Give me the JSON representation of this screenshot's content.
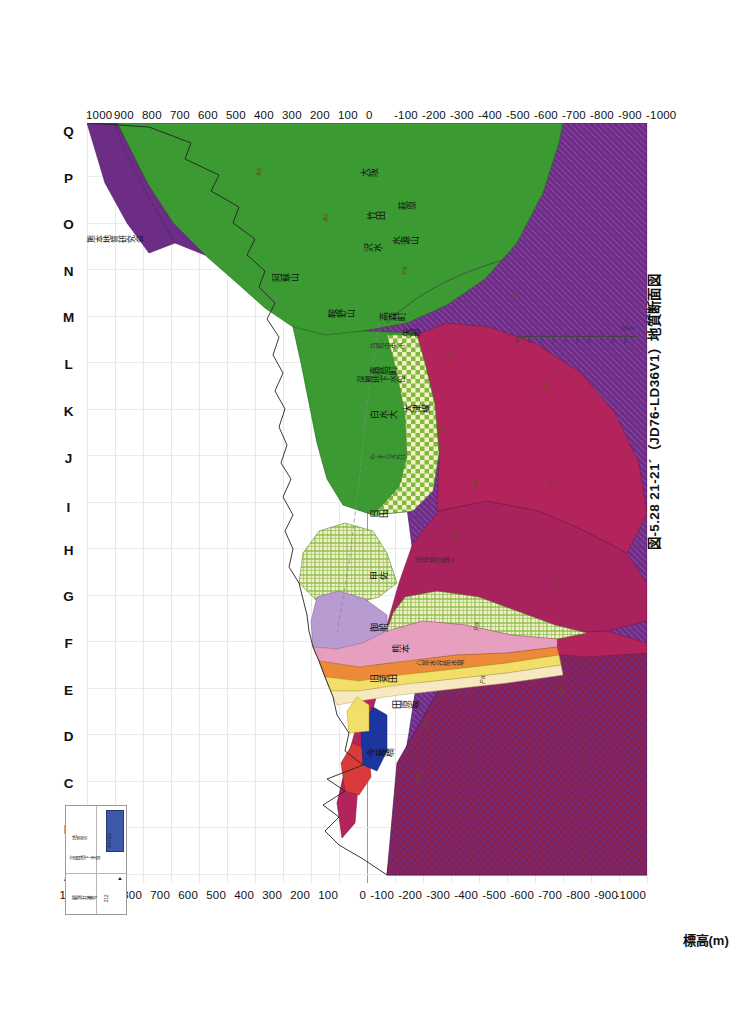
{
  "figure": {
    "caption": "図-5.28  21-21´（JD76-LD36V1）地質断面図",
    "credit": "熊本地質研究会",
    "axis_title": "標高(m)",
    "groundwater_label": "深層地下水位"
  },
  "axis": {
    "ticks": [
      "1000",
      "900",
      "800",
      "700",
      "600",
      "500",
      "400",
      "300",
      "200",
      "100",
      "0",
      "-100",
      "-200",
      "-300",
      "-400",
      "-500",
      "-600",
      "-700",
      "-800",
      "-900",
      "-1000"
    ],
    "max": 1000,
    "min": -1000,
    "step": 100
  },
  "section_letters": [
    "A",
    "B",
    "C",
    "D",
    "E",
    "F",
    "G",
    "H",
    "I",
    "J",
    "K",
    "L",
    "M",
    "N",
    "O",
    "P",
    "Q"
  ],
  "scalebar": {
    "ticks": [
      "0",
      "1",
      "2",
      "3",
      "4",
      "5",
      "6",
      "7",
      "8",
      "9"
    ],
    "unit": "10km"
  },
  "legend": {
    "rows": [
      "観測井番号",
      "深層地下水位",
      "地質区"
    ],
    "code": "212",
    "swatch_label": "熊本平野部"
  },
  "places": [
    {
      "name": "今藤橋",
      "x": 0.165,
      "y": 0.5
    },
    {
      "name": "田原坂",
      "x": 0.228,
      "y": 0.545
    },
    {
      "name": "旧菊田",
      "x": 0.262,
      "y": 0.505
    },
    {
      "name": "八景水谷給水場",
      "x": 0.283,
      "y": 0.585
    },
    {
      "name": "熊本",
      "x": 0.302,
      "y": 0.545
    },
    {
      "name": "御船",
      "x": 0.33,
      "y": 0.505
    },
    {
      "name": "甲佐",
      "x": 0.398,
      "y": 0.505
    },
    {
      "name": "砥用地区第一",
      "x": 0.419,
      "y": 0.585
    },
    {
      "name": "日田",
      "x": 0.48,
      "y": 0.505
    },
    {
      "name": "やすらぎ荘",
      "x": 0.555,
      "y": 0.505
    },
    {
      "name": "白水大",
      "x": 0.61,
      "y": 0.505
    },
    {
      "name": "大津線",
      "x": 0.618,
      "y": 0.565
    },
    {
      "name": "嘉島町",
      "x": 0.668,
      "y": 0.505
    },
    {
      "name": "益城中央小",
      "x": 0.7,
      "y": 0.505
    },
    {
      "name": "矢形",
      "x": 0.718,
      "y": 0.562
    },
    {
      "name": "高森町",
      "x": 0.738,
      "y": 0.522
    },
    {
      "name": "鞍野山",
      "x": 0.742,
      "y": 0.43
    },
    {
      "name": "阿蘇山",
      "x": 0.79,
      "y": 0.33
    },
    {
      "name": "沢水",
      "x": 0.83,
      "y": 0.495
    },
    {
      "name": "水源山",
      "x": 0.838,
      "y": 0.545
    },
    {
      "name": "竹田",
      "x": 0.872,
      "y": 0.5
    },
    {
      "name": "萩原",
      "x": 0.885,
      "y": 0.555
    },
    {
      "name": "大阪",
      "x": 0.928,
      "y": 0.488
    }
  ],
  "unit_codes": [
    {
      "code": "Pa",
      "x": 0.133,
      "y": 0.585
    },
    {
      "code": "Pa",
      "x": 0.205,
      "y": 0.6
    },
    {
      "code": "Pa",
      "x": 0.262,
      "y": 0.7
    },
    {
      "code": "Pa",
      "x": 0.332,
      "y": 0.69
    },
    {
      "code": "Pa",
      "x": 0.455,
      "y": 0.65
    },
    {
      "code": "Pa",
      "x": 0.52,
      "y": 0.685
    },
    {
      "code": "Pa",
      "x": 0.588,
      "y": 0.625
    },
    {
      "code": "Pa",
      "x": 0.69,
      "y": 0.64
    },
    {
      "code": "Pa",
      "x": 0.8,
      "y": 0.56
    },
    {
      "code": "Gr",
      "x": 0.25,
      "y": 0.84
    },
    {
      "code": "Gr",
      "x": 0.39,
      "y": 0.83
    },
    {
      "code": "Gr",
      "x": 0.52,
      "y": 0.82
    },
    {
      "code": "Gr",
      "x": 0.65,
      "y": 0.81
    },
    {
      "code": "Gr",
      "x": 0.77,
      "y": 0.76
    },
    {
      "code": "As",
      "x": 0.87,
      "y": 0.42
    },
    {
      "code": "As",
      "x": 0.93,
      "y": 0.3
    }
  ],
  "colors": {
    "aso_pyroclastic_green": "#3b9b32",
    "deep_basement_purple": "#6d2d86",
    "crimson_unit": "#b4245c",
    "magenta_unit": "#a8225e",
    "checker_green": "#8fc63d",
    "orange_unit": "#ec8a3a",
    "pink_unit": "#e79fc0",
    "lavender_unit": "#b89bd0",
    "yellow_unit": "#f2df6a",
    "cream_unit": "#f6e9c0",
    "red_unit": "#d93b3b",
    "blue_unit": "#1c35a0",
    "grid": "#e3e3e3",
    "axis": "#bdbdbd"
  }
}
